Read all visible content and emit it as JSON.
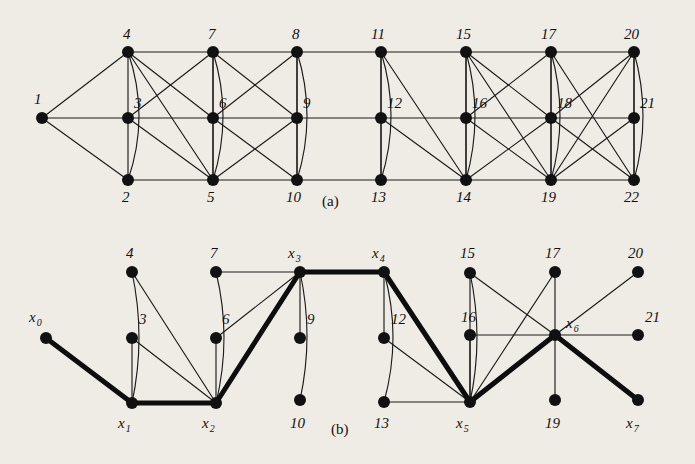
{
  "figure": {
    "title_a": "(a)",
    "title_b": "(b)",
    "background_color": "#efece6",
    "edge_color": "#1b1b1b",
    "node_color": "#111111",
    "path_color": "#0d0d0d"
  },
  "panel_a": {
    "label": "(a)",
    "label_pos": {
      "x": 322,
      "y": 206
    },
    "nodes": [
      {
        "id": "1",
        "label": "1",
        "x": 42,
        "y": 118,
        "label_x": 34,
        "label_y": 104
      },
      {
        "id": "2",
        "label": "2",
        "x": 128,
        "y": 180,
        "label_x": 122,
        "label_y": 202
      },
      {
        "id": "3",
        "label": "3",
        "x": 128,
        "y": 118,
        "label_x": 134,
        "label_y": 108
      },
      {
        "id": "4",
        "label": "4",
        "x": 128,
        "y": 52,
        "label_x": 123,
        "label_y": 39
      },
      {
        "id": "5",
        "label": "5",
        "x": 213,
        "y": 180,
        "label_x": 207,
        "label_y": 202
      },
      {
        "id": "6",
        "label": "6",
        "x": 213,
        "y": 118,
        "label_x": 219,
        "label_y": 108
      },
      {
        "id": "7",
        "label": "7",
        "x": 213,
        "y": 52,
        "label_x": 208,
        "label_y": 39
      },
      {
        "id": "8",
        "label": "8",
        "x": 297,
        "y": 52,
        "label_x": 292,
        "label_y": 39
      },
      {
        "id": "9",
        "label": "9",
        "x": 297,
        "y": 118,
        "label_x": 303,
        "label_y": 108
      },
      {
        "id": "10",
        "label": "10",
        "x": 297,
        "y": 180,
        "label_x": 286,
        "label_y": 202
      },
      {
        "id": "11",
        "label": "11",
        "x": 381,
        "y": 52,
        "label_x": 371,
        "label_y": 39
      },
      {
        "id": "12",
        "label": "12",
        "x": 381,
        "y": 118,
        "label_x": 387,
        "label_y": 108
      },
      {
        "id": "13",
        "label": "13",
        "x": 381,
        "y": 180,
        "label_x": 371,
        "label_y": 202
      },
      {
        "id": "14",
        "label": "14",
        "x": 466,
        "y": 180,
        "label_x": 456,
        "label_y": 202
      },
      {
        "id": "15",
        "label": "15",
        "x": 466,
        "y": 52,
        "label_x": 456,
        "label_y": 39
      },
      {
        "id": "16",
        "label": "16",
        "x": 466,
        "y": 118,
        "label_x": 472,
        "label_y": 108
      },
      {
        "id": "17",
        "label": "17",
        "x": 551,
        "y": 52,
        "label_x": 541,
        "label_y": 39
      },
      {
        "id": "18",
        "label": "18",
        "x": 551,
        "y": 118,
        "label_x": 557,
        "label_y": 108
      },
      {
        "id": "19",
        "label": "19",
        "x": 551,
        "y": 180,
        "label_x": 541,
        "label_y": 202
      },
      {
        "id": "20",
        "label": "20",
        "x": 634,
        "y": 52,
        "label_x": 624,
        "label_y": 39
      },
      {
        "id": "21",
        "label": "21",
        "x": 634,
        "y": 118,
        "label_x": 640,
        "label_y": 108
      },
      {
        "id": "22",
        "label": "22",
        "x": 634,
        "y": 180,
        "label_x": 624,
        "label_y": 202
      }
    ],
    "straight_edges": [
      [
        "1",
        "3"
      ],
      [
        "1",
        "4"
      ],
      [
        "1",
        "2"
      ],
      [
        "4",
        "7"
      ],
      [
        "7",
        "8"
      ],
      [
        "8",
        "11"
      ],
      [
        "11",
        "15"
      ],
      [
        "15",
        "17"
      ],
      [
        "17",
        "20"
      ],
      [
        "3",
        "6"
      ],
      [
        "6",
        "9"
      ],
      [
        "9",
        "12"
      ],
      [
        "12",
        "16"
      ],
      [
        "16",
        "18"
      ],
      [
        "18",
        "21"
      ],
      [
        "2",
        "5"
      ],
      [
        "5",
        "10"
      ],
      [
        "10",
        "13"
      ],
      [
        "13",
        "14"
      ],
      [
        "14",
        "19"
      ],
      [
        "19",
        "22"
      ],
      [
        "4",
        "3"
      ],
      [
        "3",
        "2"
      ],
      [
        "7",
        "6"
      ],
      [
        "6",
        "5"
      ],
      [
        "8",
        "9"
      ],
      [
        "9",
        "10"
      ],
      [
        "11",
        "12"
      ],
      [
        "12",
        "13"
      ],
      [
        "15",
        "16"
      ],
      [
        "16",
        "14"
      ],
      [
        "17",
        "18"
      ],
      [
        "18",
        "19"
      ],
      [
        "20",
        "21"
      ],
      [
        "21",
        "22"
      ],
      [
        "4",
        "6"
      ],
      [
        "4",
        "5"
      ],
      [
        "3",
        "5"
      ],
      [
        "3",
        "7"
      ],
      [
        "7",
        "5"
      ],
      [
        "7",
        "9"
      ],
      [
        "8",
        "6"
      ],
      [
        "8",
        "10"
      ],
      [
        "6",
        "10"
      ],
      [
        "9",
        "5"
      ],
      [
        "11",
        "13"
      ],
      [
        "11",
        "14"
      ],
      [
        "12",
        "14"
      ],
      [
        "15",
        "14"
      ],
      [
        "15",
        "18"
      ],
      [
        "15",
        "19"
      ],
      [
        "16",
        "17"
      ],
      [
        "16",
        "19"
      ],
      [
        "17",
        "19"
      ],
      [
        "17",
        "22"
      ],
      [
        "18",
        "14"
      ],
      [
        "18",
        "22"
      ],
      [
        "20",
        "19"
      ],
      [
        "20",
        "22"
      ],
      [
        "20",
        "18"
      ],
      [
        "21",
        "19"
      ]
    ],
    "curved_edges": [
      {
        "from": "4",
        "to": "2",
        "bow": -22
      },
      {
        "from": "7",
        "to": "5",
        "bow": -20
      },
      {
        "from": "8",
        "to": "10",
        "bow": -20
      },
      {
        "from": "11",
        "to": "13",
        "bow": -20
      },
      {
        "from": "15",
        "to": "14",
        "bow": -18
      },
      {
        "from": "17",
        "to": "19",
        "bow": -18
      },
      {
        "from": "20",
        "to": "22",
        "bow": -18
      }
    ]
  },
  "panel_b": {
    "label": "(b)",
    "label_pos": {
      "x": 331,
      "y": 434
    },
    "nodes": [
      {
        "id": "x0",
        "label": "x",
        "sub": "0",
        "x": 46,
        "y": 338,
        "label_x": 29,
        "label_y": 322
      },
      {
        "id": "x1",
        "label": "x",
        "sub": "1",
        "x": 132,
        "y": 403,
        "label_x": 118,
        "label_y": 428
      },
      {
        "id": "x2",
        "label": "x",
        "sub": "2",
        "x": 216,
        "y": 403,
        "label_x": 202,
        "label_y": 428
      },
      {
        "id": "x3",
        "label": "x",
        "sub": "3",
        "x": 300,
        "y": 272,
        "label_x": 288,
        "label_y": 258
      },
      {
        "id": "x4",
        "label": "x",
        "sub": "4",
        "x": 384,
        "y": 272,
        "label_x": 372,
        "label_y": 258
      },
      {
        "id": "x5",
        "label": "x",
        "sub": "5",
        "x": 470,
        "y": 402,
        "label_x": 456,
        "label_y": 428
      },
      {
        "id": "x6",
        "label": "x",
        "sub": "6",
        "x": 555,
        "y": 335,
        "label_x": 566,
        "label_y": 328
      },
      {
        "id": "x7",
        "label": "x",
        "sub": "7",
        "x": 638,
        "y": 400,
        "label_x": 626,
        "label_y": 428
      },
      {
        "id": "n3",
        "label": "3",
        "x": 132,
        "y": 338,
        "label_x": 139,
        "label_y": 324
      },
      {
        "id": "n4",
        "label": "4",
        "x": 132,
        "y": 272,
        "label_x": 126,
        "label_y": 258
      },
      {
        "id": "n6",
        "label": "6",
        "x": 216,
        "y": 338,
        "label_x": 222,
        "label_y": 324
      },
      {
        "id": "n7",
        "label": "7",
        "x": 216,
        "y": 272,
        "label_x": 210,
        "label_y": 258
      },
      {
        "id": "n9",
        "label": "9",
        "x": 300,
        "y": 338,
        "label_x": 307,
        "label_y": 324
      },
      {
        "id": "n10",
        "label": "10",
        "x": 300,
        "y": 400,
        "label_x": 290,
        "label_y": 428
      },
      {
        "id": "n12",
        "label": "12",
        "x": 384,
        "y": 338,
        "label_x": 391,
        "label_y": 324
      },
      {
        "id": "n13",
        "label": "13",
        "x": 384,
        "y": 402,
        "label_x": 374,
        "label_y": 428
      },
      {
        "id": "n15",
        "label": "15",
        "x": 470,
        "y": 273,
        "label_x": 460,
        "label_y": 258
      },
      {
        "id": "n16",
        "label": "16",
        "x": 470,
        "y": 335,
        "label_x": 461,
        "label_y": 322
      },
      {
        "id": "n17",
        "label": "17",
        "x": 555,
        "y": 272,
        "label_x": 545,
        "label_y": 258
      },
      {
        "id": "n19",
        "label": "19",
        "x": 555,
        "y": 400,
        "label_x": 545,
        "label_y": 428
      },
      {
        "id": "n20",
        "label": "20",
        "x": 638,
        "y": 272,
        "label_x": 628,
        "label_y": 258
      },
      {
        "id": "n21",
        "label": "21",
        "x": 638,
        "y": 335,
        "label_x": 645,
        "label_y": 322
      }
    ],
    "path_edges": [
      [
        "x0",
        "x1"
      ],
      [
        "x1",
        "x2"
      ],
      [
        "x2",
        "x3"
      ],
      [
        "x3",
        "x4"
      ],
      [
        "x4",
        "x5"
      ],
      [
        "x5",
        "x6"
      ],
      [
        "x6",
        "x7"
      ]
    ],
    "straight_edges": [
      [
        "n3",
        "x1"
      ],
      [
        "n3",
        "x2"
      ],
      [
        "n4",
        "x2"
      ],
      [
        "n6",
        "x2"
      ],
      [
        "n7",
        "x3"
      ],
      [
        "n6",
        "x3"
      ],
      [
        "x3",
        "n9"
      ],
      [
        "x4",
        "n12"
      ],
      [
        "x4",
        "x3"
      ],
      [
        "n12",
        "x5"
      ],
      [
        "n13",
        "x5"
      ],
      [
        "n15",
        "x5"
      ],
      [
        "n15",
        "x6"
      ],
      [
        "n16",
        "x5"
      ],
      [
        "n16",
        "x6"
      ],
      [
        "n17",
        "x5"
      ],
      [
        "n17",
        "x6"
      ],
      [
        "n19",
        "x6"
      ],
      [
        "n20",
        "x6"
      ],
      [
        "n21",
        "x6"
      ]
    ],
    "curved_edges": [
      {
        "from": "n4",
        "to": "x1",
        "bow": -14
      },
      {
        "from": "n7",
        "to": "x2",
        "bow": -16
      },
      {
        "from": "x3",
        "to": "n10",
        "bow": -14
      },
      {
        "from": "x4",
        "to": "n13",
        "bow": -18
      },
      {
        "from": "n15",
        "to": "x5",
        "bow": -14
      }
    ]
  }
}
